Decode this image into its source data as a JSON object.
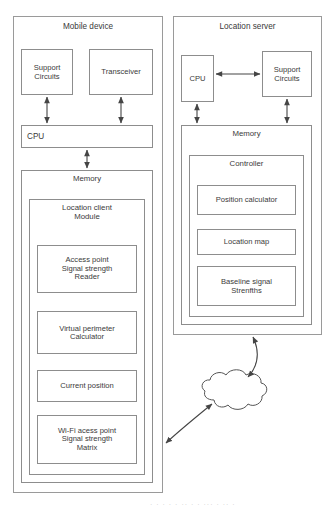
{
  "diagram": {
    "stroke_color": "#8d8d8d",
    "arrow_color": "#454545",
    "background": "#ffffff"
  },
  "mobile_device": {
    "title": "Mobile device",
    "support_circuits": "Support\nCircuits",
    "transceiver": "Transceiver",
    "cpu": "CPU",
    "memory": "Memory",
    "location_client_module": "Location client\nModule",
    "modules": [
      {
        "label": "Access point\nSignal strength\nReader"
      },
      {
        "label": "Virtual perimeter\nCalculator"
      },
      {
        "label": "Current position"
      },
      {
        "label": "Wi-Fi acess point\nSignal strength\nMatrix"
      }
    ]
  },
  "location_server": {
    "title": "Location server",
    "cpu": "CPU",
    "support_circuits": "Support\nCircuits",
    "memory": "Memory",
    "controller": "Controller",
    "modules": [
      {
        "label": "Position calculator"
      },
      {
        "label": "Location map"
      },
      {
        "label": "Baseline signal\nStrenfths"
      }
    ]
  },
  "network": {
    "label": "Network"
  },
  "artifact": {
    "text": "· · · · ·  ·· ·  · ··· · ·· ·"
  }
}
